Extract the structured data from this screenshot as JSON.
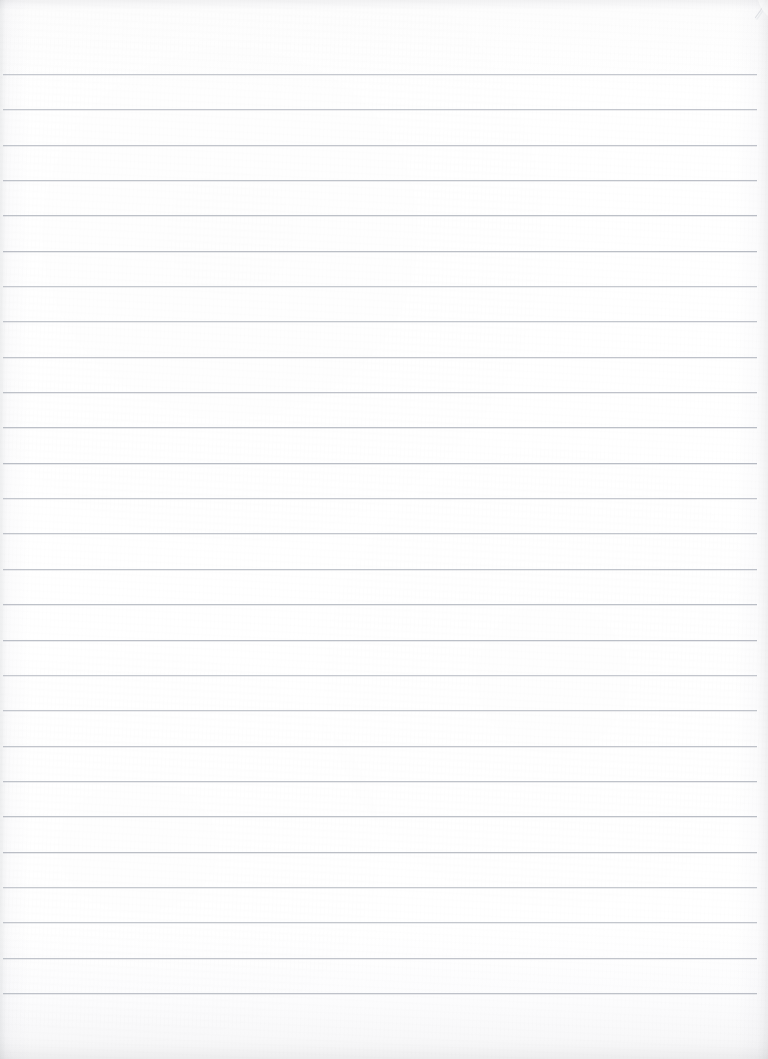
{
  "document": {
    "kind": "scanned-blank-ruled-page",
    "title": "Blank ruled notebook page (scan)",
    "text_content": "",
    "handwriting_present": "no",
    "printed_text_present": "no",
    "page_width_px": 768,
    "page_height_px": 1059,
    "orientation": "portrait"
  },
  "paper": {
    "base_color": "#fefefe",
    "highlight_color": "#ffffff",
    "shadow_edge_color": "#f4f5f6",
    "texture": "fine fibrous paper grain",
    "vignette": "soft darkening at all four scan edges, strongest at bottom"
  },
  "ruling": {
    "style": "wide-ruled horizontal lines",
    "line_color": "#b9bdc5",
    "line_thickness_px": 1,
    "line_count": 27,
    "first_line_y": 74,
    "spacing_px": 35.35,
    "line_start_x": 3,
    "line_end_x": 757,
    "has_vertical_margin_rule": "no",
    "line_y_positions": [
      74,
      109,
      145,
      180,
      215,
      251,
      286,
      321,
      357,
      392,
      427,
      463,
      498,
      533,
      569,
      604,
      640,
      675,
      710,
      746,
      781,
      816,
      852,
      887,
      922,
      958,
      993
    ]
  },
  "margins": {
    "top_label": "top margin",
    "top_height_px": 74,
    "bottom_label": "bottom margin",
    "bottom_height_px": 65,
    "left_label": "left edge margin",
    "left_width_px": 3,
    "right_label": "right edge margin",
    "right_width_px": 11
  },
  "artifacts": {
    "page_curl": {
      "label": "page corner curl",
      "position": "top-right",
      "color": "#e8e9ec"
    },
    "rule_step": {
      "label": "scanner seam step in rule lines",
      "approx_x": 660
    },
    "edge_shadow": {
      "label": "scan edge shadow",
      "color": "rgba(0,0,0,0.06)"
    }
  }
}
